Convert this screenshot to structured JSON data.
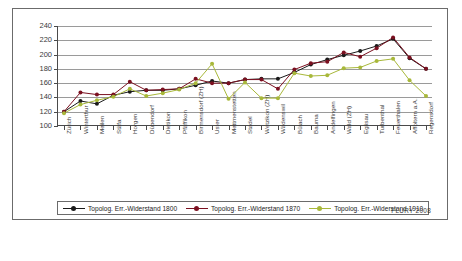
{
  "credit": "FLURY 2008",
  "legend": {
    "position": "bottom",
    "items": [
      {
        "label": "Topolog. Err.-Widerstand 1800",
        "color": "#1a1a1a"
      },
      {
        "label": "Topolog. Err.-Widerstand 1870",
        "color": "#7b1020"
      },
      {
        "label": "Topolog. Err.-Widerstand 1910",
        "color": "#a8b83a"
      }
    ]
  },
  "chart_data": {
    "type": "line",
    "title": "",
    "subtitle": "",
    "xlabel": "",
    "ylabel": "",
    "ylim": [
      100,
      240
    ],
    "yticks": [
      100,
      120,
      140,
      160,
      180,
      200,
      220,
      240
    ],
    "grid": true,
    "categories": [
      "Zürich",
      "Winterthur",
      "Meilen",
      "Stäfa",
      "Horgen",
      "Dübendorf",
      "Dietikon",
      "Pfäffikon",
      "Birmensdorf (ZH)",
      "Uster",
      "Mettmenstetten",
      "Stadel",
      "Wetzikon (ZH)",
      "Wädenswil",
      "Bülach",
      "Bauma",
      "Andelfingen",
      "Wald (ZH)",
      "Eglisau",
      "Turbenthal",
      "Feuerthalen",
      "Affoltern a.A.",
      "Regensdorf"
    ],
    "series": [
      {
        "name": "Topolog. Err.-Widerstand 1800",
        "color": "#1a1a1a",
        "values": [
          120,
          135,
          131,
          143,
          148,
          150,
          150,
          152,
          157,
          163,
          160,
          165,
          166,
          166,
          175,
          186,
          193,
          199,
          205,
          212,
          222,
          195,
          180
        ]
      },
      {
        "name": "Topolog. Err.-Widerstand 1870",
        "color": "#7b1020",
        "values": [
          120,
          147,
          144,
          144,
          162,
          150,
          151,
          152,
          166,
          160,
          160,
          165,
          165,
          152,
          179,
          188,
          190,
          203,
          197,
          209,
          224,
          196,
          180
        ]
      },
      {
        "name": "Topolog. Err.-Widerstand 1910",
        "color": "#a8b83a",
        "values": [
          118,
          130,
          136,
          141,
          152,
          142,
          146,
          151,
          160,
          187,
          138,
          161,
          139,
          139,
          174,
          170,
          171,
          181,
          182,
          191,
          194,
          164,
          142
        ]
      }
    ]
  }
}
